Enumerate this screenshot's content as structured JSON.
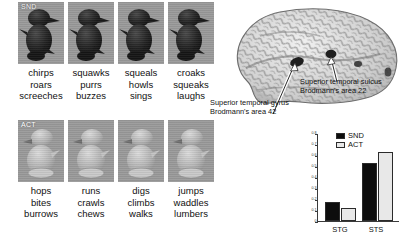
{
  "stimulus": {
    "rows": [
      {
        "condition_tag": "SND",
        "cells": [
          {
            "words": [
              "chirps",
              "roars",
              "screeches"
            ]
          },
          {
            "words": [
              "squawks",
              "purrs",
              "buzzes"
            ]
          },
          {
            "words": [
              "squeals",
              "howls",
              "sings"
            ]
          },
          {
            "words": [
              "croaks",
              "squeaks",
              "laughs"
            ]
          }
        ]
      },
      {
        "condition_tag": "ACT",
        "cells": [
          {
            "words": [
              "hops",
              "bites",
              "burrows"
            ]
          },
          {
            "words": [
              "runs",
              "crawls",
              "chews"
            ]
          },
          {
            "words": [
              "digs",
              "climbs",
              "walks"
            ]
          },
          {
            "words": [
              "jumps",
              "waddles",
              "lumbers"
            ]
          }
        ]
      }
    ]
  },
  "brain": {
    "annotations": [
      {
        "id": "stg",
        "line1": "Superior temporal gyrus",
        "line2": "Brodmann's area 42"
      },
      {
        "id": "sts",
        "line1": "Superior temporal sulcus",
        "line2": "Brodmann's area 22"
      }
    ]
  },
  "chart_data": {
    "type": "bar",
    "title": "",
    "xlabel": "",
    "ylabel": "",
    "categories": [
      "STG",
      "STS"
    ],
    "series": [
      {
        "name": "SND",
        "color": "#0d0d0d",
        "values": [
          0.17,
          0.53
        ]
      },
      {
        "name": "ACT",
        "color": "#e8e8e8",
        "values": [
          0.12,
          0.63
        ]
      }
    ],
    "ylim": [
      0,
      0.8
    ],
    "yticks": [
      0,
      0.1,
      0.2,
      0.3,
      0.4,
      0.5,
      0.6,
      0.7,
      0.8
    ],
    "ytick_labels": [
      "0",
      "0.1",
      "0.2",
      "0.3",
      "0.4",
      "0.5",
      "0.6",
      "0.7",
      "0.8"
    ],
    "grid": false,
    "legend_position": "top-left"
  }
}
